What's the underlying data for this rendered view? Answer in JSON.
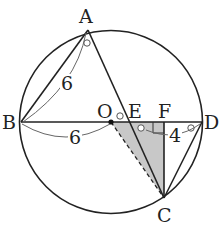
{
  "diagram": {
    "type": "circle-geometry",
    "points": {
      "A": {
        "label": "A",
        "x": 88,
        "y": 30
      },
      "B": {
        "label": "B",
        "x": 21,
        "y": 122
      },
      "C": {
        "label": "C",
        "x": 164,
        "y": 198
      },
      "D": {
        "label": "D",
        "x": 202,
        "y": 122
      },
      "O": {
        "label": "O",
        "x": 111,
        "y": 122
      },
      "E": {
        "label": "E",
        "x": 129,
        "y": 122
      },
      "F": {
        "label": "F",
        "x": 164,
        "y": 122
      }
    },
    "measures": {
      "AB": "6",
      "BO": "6",
      "FD": "4"
    },
    "colors": {
      "stroke": "#222222",
      "shade": "#c8c8c8",
      "arc": "#555555"
    }
  }
}
